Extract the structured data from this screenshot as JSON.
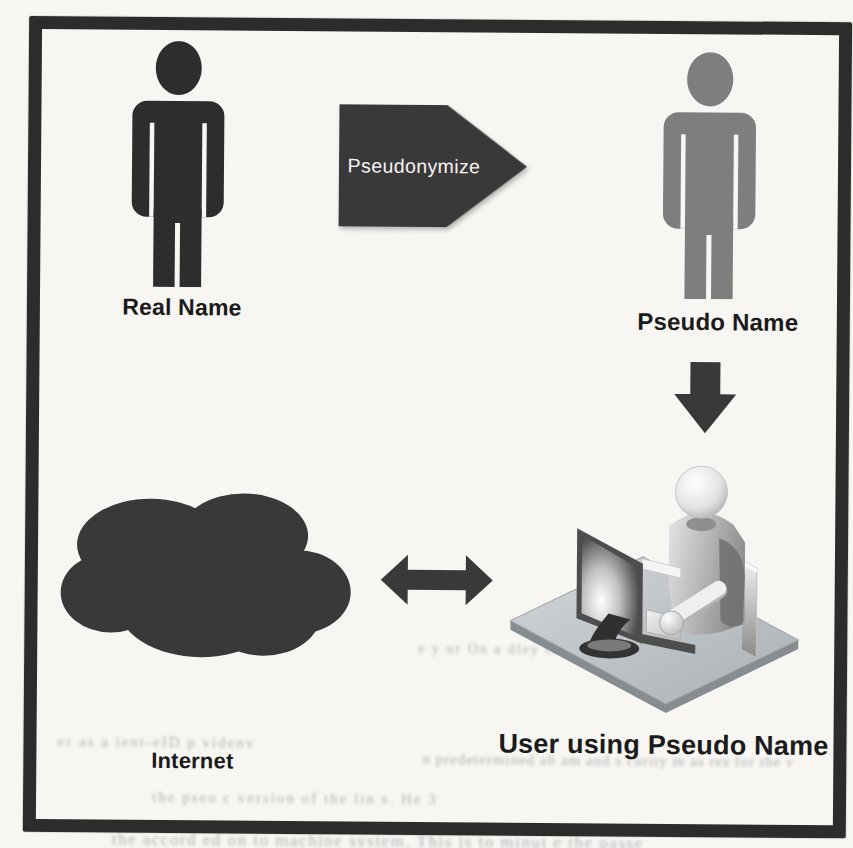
{
  "labels": {
    "real_name": "Real Name",
    "pseudo_name": "Pseudo Name",
    "pseudonymize": "Pseudonymize",
    "user_pseudo": "User using Pseudo Name",
    "internet": "Internet"
  },
  "ghost_text": [
    {
      "text": "er as a ient-eID p videnv"
    },
    {
      "text": "n predetermined ab am and s curity m as res for the v"
    },
    {
      "text": "the pseu c version of the lin s. He 3"
    },
    {
      "text": "the accord ed on to machine system. This is to minut e the passe"
    },
    {
      "text": "e y ur On a dley Obe t"
    }
  ],
  "icons": {
    "person-icon": "standing person silhouette",
    "pseudonymize-arrow-icon": "right-pointing block arrow",
    "down-arrow-icon": "downward block arrow",
    "cloud-icon": "cloud silhouette",
    "double-arrow-icon": "horizontal double-headed block arrow",
    "computer-user-icon": "3d person sitting at computer workstation"
  },
  "colors": {
    "paper": "#f7f6f2",
    "frame_border": "#2e2c2a",
    "figure_dark": "#2e2d2d",
    "figure_gray": "#7e7e7e",
    "shape_dark": "#3a3939",
    "arrow_text": "#f5f5f5",
    "label_text": "#1b1b1b",
    "ghost_text": "#4d4d58"
  }
}
